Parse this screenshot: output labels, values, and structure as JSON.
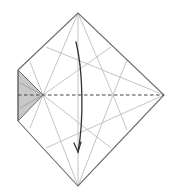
{
  "diagram": {
    "type": "origami-fold-step",
    "colors": {
      "background": "#ffffff",
      "edge": "#6b6b6b",
      "crease": "#bdbdbd",
      "valley_line": "#444444",
      "flap_fill": "#c8c8c8",
      "arrow": "#333333"
    },
    "vertices": {
      "top": [
        78,
        13
      ],
      "right": [
        164,
        95
      ],
      "bottom": [
        78,
        186
      ],
      "left_top": [
        18,
        70
      ],
      "left_bottom": [
        18,
        121
      ],
      "flap_tip": [
        43,
        95
      ]
    },
    "fold_line": {
      "style": "dashed",
      "kind": "valley-fold",
      "from": [
        18,
        95
      ],
      "to": [
        164,
        95
      ]
    },
    "arrow": {
      "direction": "down",
      "start": [
        76,
        42
      ],
      "end": [
        78,
        152
      ]
    },
    "labels": []
  }
}
